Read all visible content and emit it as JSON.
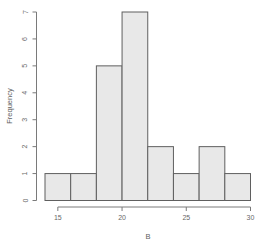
{
  "figure": {
    "background": "#ffffff"
  },
  "chart_data": {
    "type": "bar",
    "subtype": "histogram",
    "title": "",
    "xlabel": "B",
    "ylabel": "Frequency",
    "bin_edges": [
      14,
      16,
      18,
      20,
      22,
      24,
      26,
      28,
      30
    ],
    "counts": [
      1,
      1,
      5,
      7,
      2,
      1,
      2,
      1
    ],
    "categories": [
      "14-16",
      "16-18",
      "18-20",
      "20-22",
      "22-24",
      "24-26",
      "26-28",
      "28-30"
    ],
    "values": [
      1,
      1,
      5,
      7,
      2,
      1,
      2,
      1
    ],
    "x_ticks": [
      15,
      20,
      25,
      30
    ],
    "y_ticks": [
      0,
      1,
      2,
      3,
      4,
      5,
      6,
      7
    ],
    "xlim": [
      14,
      30
    ],
    "ylim": [
      0,
      7
    ],
    "grid": false,
    "legend": null,
    "bar_fill": "#e8e8e8",
    "bar_stroke": "#5f5f5f",
    "axis_color": "#7a7a7a",
    "text_color": "#686868"
  }
}
